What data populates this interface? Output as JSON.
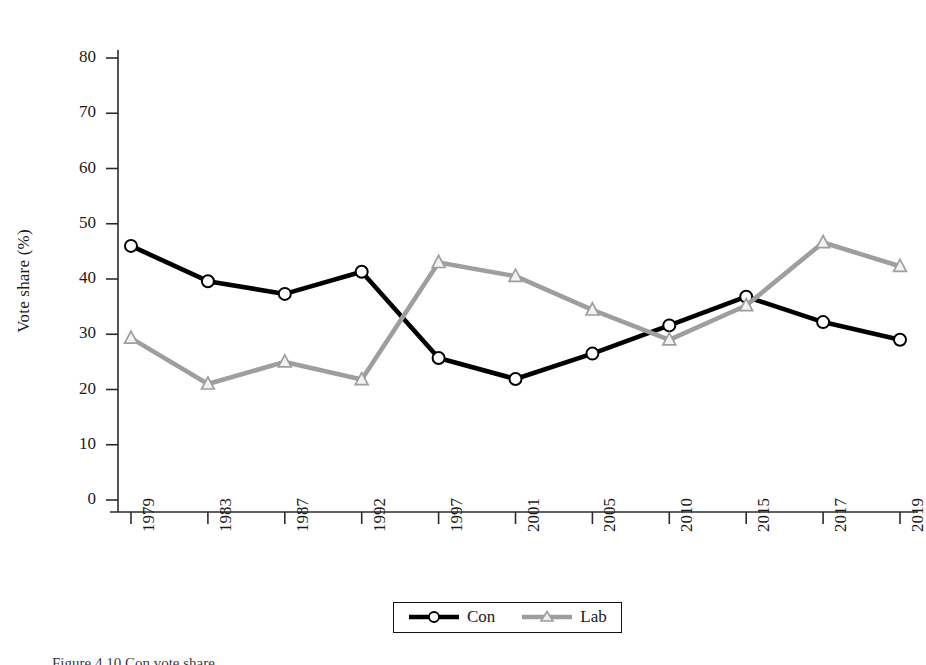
{
  "chart_data": {
    "type": "line",
    "title": "",
    "xlabel": "",
    "ylabel": "Vote share (%)",
    "categories": [
      "1979",
      "1983",
      "1987",
      "1992",
      "1997",
      "2001",
      "2005",
      "2010",
      "2015",
      "2017",
      "2019"
    ],
    "ylim": [
      0,
      80
    ],
    "yticks": [
      0,
      10,
      20,
      30,
      40,
      50,
      60,
      70,
      80
    ],
    "grid": false,
    "legend_position": "bottom-center",
    "series": [
      {
        "name": "Con",
        "color": "#000000",
        "marker": "circle",
        "values": [
          46.0,
          39.6,
          37.3,
          41.3,
          25.7,
          21.9,
          26.5,
          31.6,
          36.8,
          32.2,
          29.0
        ]
      },
      {
        "name": "Lab",
        "color": "#9e9e9e",
        "marker": "triangle",
        "values": [
          29.3,
          21.0,
          25.0,
          21.8,
          43.0,
          40.5,
          34.4,
          29.0,
          35.2,
          46.6,
          42.3
        ]
      }
    ]
  },
  "axes": {
    "y_title": "Vote share (%)",
    "y_tick_labels": [
      "80",
      "70",
      "60",
      "50",
      "40",
      "30",
      "20",
      "10",
      "0"
    ],
    "x_tick_labels": [
      "1979",
      "1983",
      "1987",
      "1992",
      "1997",
      "2001",
      "2005",
      "2010",
      "2015",
      "2017",
      "2019"
    ]
  },
  "legend": {
    "entries": [
      {
        "label": "Con",
        "marker": "circle-marker-icon",
        "color": "#000000"
      },
      {
        "label": "Lab",
        "marker": "triangle-marker-icon",
        "color": "#9e9e9e"
      }
    ]
  },
  "caption": {
    "text": "Figure 4.10  Con vote share"
  }
}
